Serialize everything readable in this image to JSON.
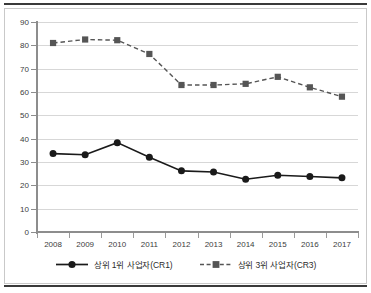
{
  "chart_data": {
    "type": "line",
    "title": "",
    "subtitle": "",
    "xlabel": "",
    "ylabel": "",
    "categories": [
      "2008",
      "2009",
      "2010",
      "2011",
      "2012",
      "2013",
      "2014",
      "2015",
      "2016",
      "2017"
    ],
    "ylim": [
      0,
      90
    ],
    "ytick_values": [
      0,
      10,
      20,
      30,
      40,
      50,
      60,
      70,
      80,
      90
    ],
    "ytick_labels": [
      "0",
      "10",
      "20",
      "30",
      "40",
      "50",
      "60",
      "70",
      "80",
      "90"
    ],
    "grid": "horizontal",
    "legend_position": "bottom-center",
    "series": [
      {
        "name": "상위 1위 사업자(CR1)",
        "marker": "circle",
        "linestyle": "solid",
        "color": "#1a1a1a",
        "values": [
          33.6,
          33.1,
          38.3,
          32.0,
          26.2,
          25.7,
          22.6,
          24.3,
          23.8,
          23.2
        ]
      },
      {
        "name": "상위 3위 사업자(CR3)",
        "marker": "square",
        "linestyle": "dashed",
        "color": "#555555",
        "values": [
          81.0,
          82.5,
          82.2,
          76.3,
          63.0,
          63.0,
          63.5,
          66.5,
          62.0,
          58.0
        ]
      }
    ]
  },
  "legend": {
    "entries": [
      {
        "label": "상위 1위 사업자(CR1)"
      },
      {
        "label": "상위 3위 사업자(CR3)"
      }
    ]
  },
  "colors": {
    "cr1": "#1a1a1a",
    "cr3": "#555555",
    "grid": "#d7d7d7",
    "axis": "#8d8d8d",
    "frame": "#c9c9c9",
    "rule": "#3a3a3a",
    "text": "#3c3c3c",
    "background": "#ffffff"
  }
}
